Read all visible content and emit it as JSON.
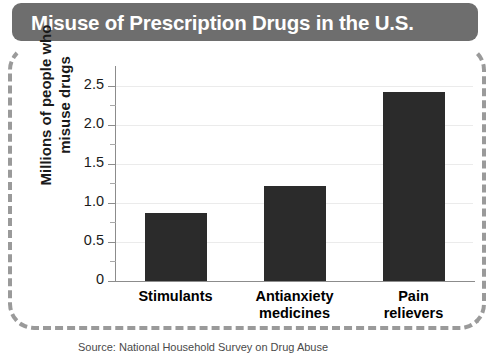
{
  "title": "Misuse of Prescription Drugs in the U.S.",
  "source_note": "Source: National Household Survey on Drug Abuse",
  "colors": {
    "title_bar": "#6e6e6e",
    "title_text": "#ffffff",
    "bar": "#2b2b2b",
    "gridline": "#ebebeb",
    "axis": "#8c8c8c",
    "dashed_border": "#9a9a9a",
    "background": "#ffffff"
  },
  "chart_data": {
    "type": "bar",
    "title": "Misuse of Prescription Drugs in the U.S.",
    "categories": [
      "Stimulants",
      "Antianxiety medicines",
      "Pain relievers"
    ],
    "category_lines": [
      [
        "Stimulants"
      ],
      [
        "Antianxiety",
        "medicines"
      ],
      [
        "Pain",
        "relievers"
      ]
    ],
    "values": [
      0.87,
      1.22,
      2.42
    ],
    "xlabel": "",
    "ylabel": "Millions of people who misuse drugs",
    "ylabel_lines": [
      "Millions of people who",
      "misuse drugs"
    ],
    "ylim": [
      0,
      2.6
    ],
    "yticks": [
      0,
      0.5,
      1.0,
      1.5,
      2.0,
      2.5
    ],
    "ytick_labels": [
      "0",
      "0.5",
      "1.0",
      "1.5",
      "2.0",
      "2.5"
    ],
    "yminor_ticks": [
      0.25,
      0.75,
      1.25,
      1.75,
      2.25
    ],
    "grid": true,
    "grid_axis": "y",
    "legend": false
  }
}
